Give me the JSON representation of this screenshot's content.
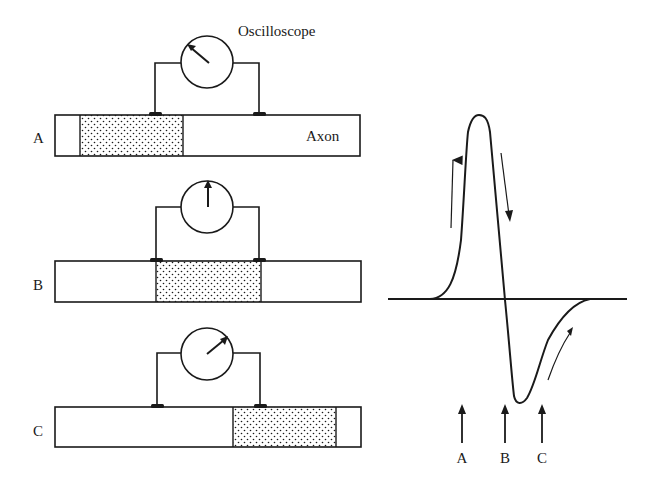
{
  "figure": {
    "oscilloscope_label": "Oscilloscope",
    "axon_label": "Axon",
    "panels": [
      {
        "label": "A",
        "stipple_x": [
          80,
          183
        ],
        "needle": "left",
        "y_top": 115
      },
      {
        "label": "B",
        "stipple_x": [
          156,
          261
        ],
        "needle": "up",
        "y_top": 261
      },
      {
        "label": "C",
        "stipple_x": [
          233,
          336
        ],
        "needle": "right",
        "y_top": 407
      }
    ],
    "trace": {
      "markers": [
        {
          "label": "A",
          "x": 462
        },
        {
          "label": "B",
          "x": 505
        },
        {
          "label": "C",
          "x": 542
        }
      ]
    }
  },
  "colors": {
    "ink": "#1a1a1a",
    "background": "#ffffff"
  }
}
